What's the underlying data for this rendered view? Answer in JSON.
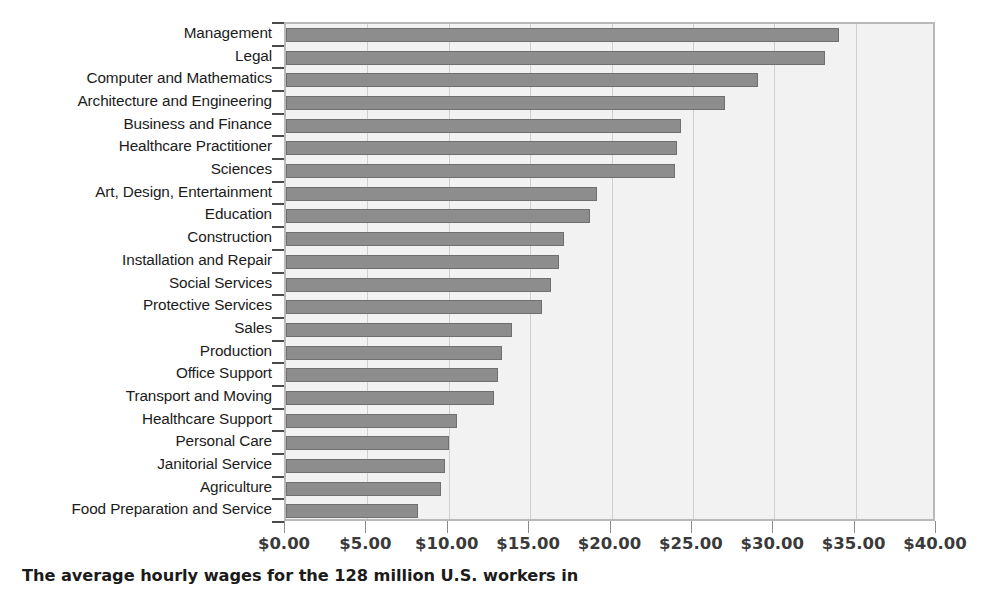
{
  "chart_data": {
    "type": "bar",
    "orientation": "horizontal",
    "title": "",
    "subtitle": "",
    "xlabel": "",
    "ylabel": "",
    "xlim": [
      0,
      40
    ],
    "ylim": null,
    "grid": true,
    "legend": null,
    "legend_position": "none",
    "xtick_labels": [
      "$0.00",
      "$5.00",
      "$10.00",
      "$15.00",
      "$20.00",
      "$25.00",
      "$30.00",
      "$35.00",
      "$40.00"
    ],
    "xtick_values": [
      0,
      5,
      10,
      15,
      20,
      25,
      30,
      35,
      40
    ],
    "xtick_step": 5,
    "value_prefix": "$",
    "categories": [
      "Management",
      "Legal",
      "Computer and Mathematics",
      "Architecture and Engineering",
      "Business and Finance",
      "Healthcare Practitioner",
      "Sciences",
      "Art, Design, Entertainment",
      "Education",
      "Construction",
      "Installation and Repair",
      "Social Services",
      "Protective Services",
      "Sales",
      "Production",
      "Office Support",
      "Transport and Moving",
      "Healthcare Support",
      "Personal Care",
      "Janitorial Service",
      "Agriculture",
      "Food Preparation and Service"
    ],
    "values": [
      34.0,
      33.1,
      29.0,
      27.0,
      24.3,
      24.0,
      23.9,
      19.1,
      18.7,
      17.1,
      16.8,
      16.3,
      15.7,
      13.9,
      13.3,
      13.0,
      12.8,
      10.5,
      10.0,
      9.8,
      9.5,
      8.1
    ],
    "bar_color": "#8d8d8d",
    "bar_border_color": "#6f6f6f",
    "plot_background": "#f2f2f2",
    "gridline_color": "#cfcfcf"
  },
  "caption": {
    "text": "The average hourly wages for the 128 million U.S. workers in"
  }
}
